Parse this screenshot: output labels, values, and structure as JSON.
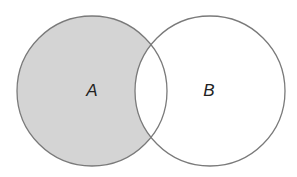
{
  "diagram": {
    "type": "venn",
    "operation_shown": "A minus B (shaded region of A outside B)",
    "colors": {
      "background": "#ffffff",
      "shaded_fill": "#d4d4d4",
      "outline": "#7a7a7a",
      "label": "#222222"
    },
    "sets": [
      {
        "id": "A",
        "label": "A",
        "cx": 92,
        "cy": 91,
        "r": 75,
        "shaded": true
      },
      {
        "id": "B",
        "label": "B",
        "cx": 210,
        "cy": 91,
        "r": 75,
        "shaded": false
      }
    ],
    "intersection_shaded": false
  }
}
